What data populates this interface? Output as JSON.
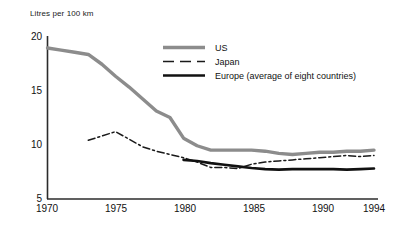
{
  "chart_data": {
    "type": "line",
    "title": "",
    "subtitle": "",
    "ylabel": "Litres per 100 km",
    "xlabel": "",
    "grid": false,
    "legend_position": "top-center",
    "xlim": [
      1970,
      1994
    ],
    "ylim": [
      5,
      20
    ],
    "xticks": [
      1970,
      1975,
      1980,
      1985,
      1990,
      1994
    ],
    "yticks": [
      5,
      10,
      15,
      20
    ],
    "xtick_labels": [
      "1970",
      "1975",
      "1980",
      "1985",
      "1990",
      "1994"
    ],
    "ytick_labels": [
      "5",
      "10",
      "15",
      "20"
    ],
    "series": [
      {
        "name": "US",
        "style": "thick-grey",
        "color": "#8c8c8c",
        "x": [
          1970,
          1971,
          1972,
          1973,
          1974,
          1975,
          1976,
          1977,
          1978,
          1979,
          1980,
          1981,
          1982,
          1983,
          1984,
          1985,
          1986,
          1987,
          1988,
          1989,
          1990,
          1991,
          1992,
          1993,
          1994
        ],
        "values": [
          18.9,
          18.7,
          18.5,
          18.3,
          17.4,
          16.3,
          15.3,
          14.2,
          13.1,
          12.5,
          10.6,
          9.9,
          9.5,
          9.5,
          9.5,
          9.5,
          9.4,
          9.2,
          9.1,
          9.2,
          9.3,
          9.3,
          9.4,
          9.4,
          9.5
        ]
      },
      {
        "name": "Japan",
        "style": "dash-dot",
        "color": "#1a1a1a",
        "x": [
          1973,
          1974,
          1975,
          1976,
          1977,
          1978,
          1979,
          1980,
          1981,
          1982,
          1983,
          1984,
          1985,
          1986,
          1987,
          1988,
          1989,
          1990,
          1991,
          1992,
          1993,
          1994
        ],
        "values": [
          10.4,
          10.8,
          11.2,
          10.5,
          9.8,
          9.4,
          9.1,
          8.8,
          8.4,
          7.9,
          7.9,
          7.8,
          8.2,
          8.4,
          8.5,
          8.6,
          8.7,
          8.8,
          8.9,
          9.0,
          8.9,
          9.0
        ]
      },
      {
        "name": "Europe (average of eight countries)",
        "style": "thick-black",
        "color": "#111111",
        "x": [
          1980,
          1981,
          1982,
          1983,
          1984,
          1985,
          1986,
          1987,
          1988,
          1989,
          1990,
          1991,
          1992,
          1993,
          1994
        ],
        "values": [
          8.6,
          8.5,
          8.3,
          8.15,
          8.0,
          7.85,
          7.75,
          7.7,
          7.75,
          7.75,
          7.75,
          7.75,
          7.7,
          7.75,
          7.8
        ]
      }
    ]
  },
  "legend": {
    "items": [
      {
        "label": "US"
      },
      {
        "label": "Japan"
      },
      {
        "label": "Europe (average of eight countries)"
      }
    ]
  },
  "axes": {
    "y_axis_title": "Litres per 100 km",
    "y_labels": [
      "20",
      "15",
      "10",
      "5"
    ],
    "x_labels": [
      "1970",
      "1975",
      "1980",
      "1985",
      "1990",
      "1994"
    ]
  },
  "colors": {
    "us_line": "#8c8c8c",
    "japan_line": "#1a1a1a",
    "europe_line": "#111111",
    "axis": "#2b2b2b",
    "background": "#ffffff"
  }
}
